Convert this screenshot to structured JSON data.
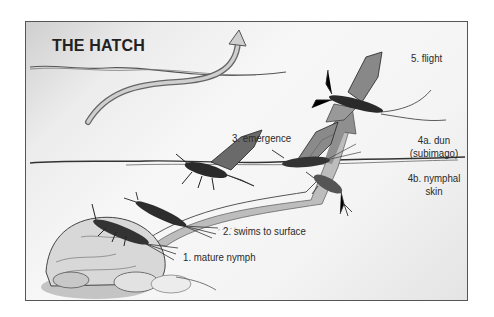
{
  "diagram": {
    "title": "THE HATCH",
    "stages": [
      {
        "id": "1",
        "label": "1. mature nymph"
      },
      {
        "id": "2",
        "label": "2. swims to surface"
      },
      {
        "id": "3",
        "label": "3. emergence"
      },
      {
        "id": "4a",
        "label_line1": "4a. dun",
        "label_line2": "(subimago)"
      },
      {
        "id": "4b",
        "label_line1": "4b. nymphal",
        "label_line2": "skin"
      },
      {
        "id": "5",
        "label": "5. flight"
      }
    ],
    "icons": {
      "rock": "rock-illustration",
      "nymph": "mayfly-nymph-illustration",
      "emerging": "emerging-mayfly-illustration",
      "dun": "mayfly-dun-illustration",
      "adult": "flying-mayfly-illustration",
      "arrow": "curved-arrow"
    },
    "colors": {
      "ink": "#222222",
      "arrow_fill": "#9a9a9a",
      "frame_border": "#555555",
      "background": "#f4f4f4"
    }
  }
}
